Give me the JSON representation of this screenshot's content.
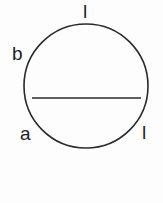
{
  "diagram": {
    "type": "circle-with-chord",
    "stroke_color": "#2a2a2a",
    "background": "#fdfdfd",
    "circle": {
      "cx": 86,
      "cy": 86,
      "r": 62
    },
    "chord": {
      "x1": 32,
      "y1": 98,
      "x2": 141,
      "y2": 98
    },
    "labels": {
      "top": "l",
      "upper_left": "b",
      "lower_left": "a",
      "lower_right": "l"
    }
  }
}
